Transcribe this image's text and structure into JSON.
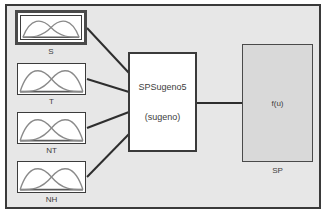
{
  "colors": {
    "canvas_bg": "#ffffff",
    "frame_bg": "#e7e7e7",
    "frame_border": "#3a3a3a",
    "node_fill": "#ffffff",
    "node_border": "#3c3c3c",
    "selected_border": "#4a4a4a",
    "output_fill": "#d9d9d9",
    "curve_stroke": "#8a8a8a",
    "line_color": "#2e2e2e",
    "text_color": "#3d3d3d"
  },
  "diagram": {
    "kind": "fuzzy-inference-system-editor",
    "fis_name": "SPSugeno5",
    "fis_type_label": "(sugeno)",
    "inputs": [
      {
        "label": "S",
        "selected": true,
        "icon": "membership-functions-icon"
      },
      {
        "label": "T",
        "selected": false,
        "icon": "membership-functions-icon"
      },
      {
        "label": "NT",
        "selected": false,
        "icon": "membership-functions-icon"
      },
      {
        "label": "NH",
        "selected": false,
        "icon": "membership-functions-icon"
      }
    ],
    "output": {
      "label": "SP",
      "text": "f(u)"
    }
  }
}
